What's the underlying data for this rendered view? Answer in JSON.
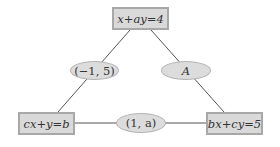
{
  "diagram": {
    "nodes": {
      "top": {
        "label": "x+ay=4"
      },
      "bottom_left": {
        "label": "cx+y=b"
      },
      "bottom_right": {
        "label": "bx+cy=5"
      }
    },
    "edge_labels": {
      "top_left": {
        "label": "(−1, 5)"
      },
      "top_right": {
        "label": "A"
      },
      "bottom": {
        "label": "(1, a)"
      }
    },
    "colors": {
      "box_fill": "#d9d9d9",
      "box_border": "#a8a8a8",
      "ellipse_fill": "#dcdcdc",
      "line": "#555555",
      "text": "#333333"
    }
  }
}
